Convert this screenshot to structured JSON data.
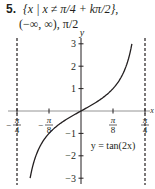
{
  "header": {
    "number": "5.",
    "line1": "{x | x ≠ π/4 + kπ/2},",
    "line2": "(−∞, ∞), π/2"
  },
  "chart_data": {
    "type": "line",
    "title": "",
    "annotation": "y = tan(2x)",
    "xlabel": "x",
    "ylabel": "y",
    "xlim": [
      -0.7854,
      0.7854
    ],
    "ylim": [
      -3,
      3
    ],
    "x_ticks": [
      {
        "value": -0.7854,
        "num": "π",
        "den": "4",
        "neg": true
      },
      {
        "value": -0.3927,
        "num": "π",
        "den": "8",
        "neg": true
      },
      {
        "value": 0.3927,
        "num": "π",
        "den": "8",
        "neg": false
      },
      {
        "value": 0.7854,
        "num": "π",
        "den": "4",
        "neg": false
      }
    ],
    "y_ticks": [
      {
        "value": 3,
        "label": "3"
      },
      {
        "value": 2,
        "label": "2"
      },
      {
        "value": 1,
        "label": "1"
      },
      {
        "value": -1,
        "label": "−1"
      },
      {
        "value": -2,
        "label": "−2"
      },
      {
        "value": -3,
        "label": "−3"
      }
    ],
    "asymptotes": [
      -0.7854,
      0.7854
    ],
    "series": [
      {
        "name": "y = tan(2x)",
        "function": "tan(2x)",
        "domain": [
          -0.6245,
          0.6245
        ]
      }
    ],
    "grid": false
  }
}
